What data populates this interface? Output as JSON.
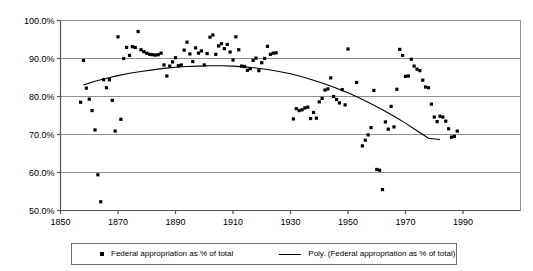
{
  "chart_data": {
    "type": "scatter",
    "title": "",
    "xlabel": "",
    "ylabel": "",
    "xlim": [
      1850,
      2010
    ],
    "ylim": [
      50,
      100
    ],
    "grid": true,
    "y_ticks": [
      50,
      60,
      70,
      80,
      90,
      100
    ],
    "y_tick_labels": [
      "50.0%",
      "60.0%",
      "70.0%",
      "80.0%",
      "90.0%",
      "100.0%"
    ],
    "x_ticks": [
      1850,
      1870,
      1890,
      1910,
      1930,
      1950,
      1970,
      1990
    ],
    "x_tick_labels": [
      "1850",
      "1870",
      "1890",
      "1910",
      "1930",
      "1950",
      "1970",
      "1990"
    ],
    "legend_position": "bottom",
    "series": [
      {
        "name": "Federal appropriation as % of total",
        "type": "scatter",
        "marker": "square",
        "color": "#000000",
        "points": [
          [
            1857,
            78.5
          ],
          [
            1858,
            89.5
          ],
          [
            1859,
            82.2
          ],
          [
            1860,
            79.3
          ],
          [
            1861,
            76.3
          ],
          [
            1862,
            71.2
          ],
          [
            1863,
            59.4
          ],
          [
            1864,
            52.3
          ],
          [
            1865,
            84.4
          ],
          [
            1866,
            82.3
          ],
          [
            1867,
            84.4
          ],
          [
            1868,
            79.0
          ],
          [
            1869,
            70.9
          ],
          [
            1870,
            95.7
          ],
          [
            1871,
            74.0
          ],
          [
            1872,
            90.0
          ],
          [
            1873,
            92.9
          ],
          [
            1874,
            90.8
          ],
          [
            1875,
            93.1
          ],
          [
            1876,
            92.9
          ],
          [
            1877,
            97.1
          ],
          [
            1878,
            92.3
          ],
          [
            1879,
            91.8
          ],
          [
            1880,
            91.4
          ],
          [
            1881,
            91.1
          ],
          [
            1882,
            91.0
          ],
          [
            1883,
            90.9
          ],
          [
            1884,
            91.0
          ],
          [
            1885,
            91.4
          ],
          [
            1886,
            88.3
          ],
          [
            1887,
            85.4
          ],
          [
            1888,
            88.0
          ],
          [
            1889,
            89.1
          ],
          [
            1890,
            90.2
          ],
          [
            1891,
            88.1
          ],
          [
            1892,
            88.3
          ],
          [
            1893,
            92.2
          ],
          [
            1894,
            94.3
          ],
          [
            1895,
            91.2
          ],
          [
            1896,
            89.2
          ],
          [
            1897,
            92.8
          ],
          [
            1898,
            91.4
          ],
          [
            1899,
            92.0
          ],
          [
            1900,
            88.3
          ],
          [
            1901,
            91.3
          ],
          [
            1902,
            95.6
          ],
          [
            1903,
            96.2
          ],
          [
            1904,
            91.1
          ],
          [
            1905,
            93.3
          ],
          [
            1906,
            93.9
          ],
          [
            1907,
            92.6
          ],
          [
            1908,
            93.7
          ],
          [
            1909,
            91.7
          ],
          [
            1910,
            89.6
          ],
          [
            1911,
            95.7
          ],
          [
            1912,
            92.3
          ],
          [
            1913,
            88.0
          ],
          [
            1914,
            87.9
          ],
          [
            1915,
            86.9
          ],
          [
            1916,
            87.3
          ],
          [
            1917,
            89.5
          ],
          [
            1918,
            90.1
          ],
          [
            1919,
            86.8
          ],
          [
            1920,
            88.9
          ],
          [
            1921,
            90.0
          ],
          [
            1922,
            93.2
          ],
          [
            1923,
            91.1
          ],
          [
            1924,
            91.4
          ],
          [
            1925,
            91.5
          ],
          [
            1931,
            74.1
          ],
          [
            1932,
            76.8
          ],
          [
            1933,
            76.3
          ],
          [
            1934,
            76.5
          ],
          [
            1935,
            77.0
          ],
          [
            1936,
            77.2
          ],
          [
            1937,
            74.2
          ],
          [
            1938,
            75.8
          ],
          [
            1939,
            74.3
          ],
          [
            1940,
            78.6
          ],
          [
            1941,
            79.5
          ],
          [
            1942,
            81.7
          ],
          [
            1943,
            82.0
          ],
          [
            1944,
            84.9
          ],
          [
            1945,
            80.0
          ],
          [
            1946,
            79.2
          ],
          [
            1947,
            78.3
          ],
          [
            1948,
            81.8
          ],
          [
            1949,
            77.8
          ],
          [
            1950,
            92.5
          ],
          [
            1953,
            83.7
          ],
          [
            1955,
            67.0
          ],
          [
            1956,
            68.5
          ],
          [
            1957,
            69.9
          ],
          [
            1958,
            71.8
          ],
          [
            1959,
            81.6
          ],
          [
            1960,
            60.8
          ],
          [
            1961,
            60.6
          ],
          [
            1962,
            55.5
          ],
          [
            1963,
            73.3
          ],
          [
            1964,
            71.4
          ],
          [
            1965,
            77.4
          ],
          [
            1966,
            72.0
          ],
          [
            1967,
            81.9
          ],
          [
            1968,
            92.4
          ],
          [
            1969,
            90.8
          ],
          [
            1970,
            85.3
          ],
          [
            1971,
            85.4
          ],
          [
            1972,
            89.8
          ],
          [
            1973,
            88.0
          ],
          [
            1974,
            87.2
          ],
          [
            1975,
            86.8
          ],
          [
            1976,
            84.3
          ],
          [
            1977,
            82.5
          ],
          [
            1978,
            82.3
          ],
          [
            1979,
            78.0
          ],
          [
            1980,
            74.6
          ],
          [
            1981,
            73.4
          ],
          [
            1982,
            74.8
          ],
          [
            1983,
            74.6
          ],
          [
            1984,
            73.5
          ],
          [
            1985,
            71.5
          ],
          [
            1986,
            69.3
          ],
          [
            1987,
            69.5
          ],
          [
            1988,
            70.9
          ]
        ]
      },
      {
        "name": "Poly. (Federal appropriation as % of total)",
        "type": "line",
        "color": "#000000",
        "points": [
          [
            1858,
            83.0
          ],
          [
            1862,
            84.0
          ],
          [
            1866,
            84.8
          ],
          [
            1870,
            85.5
          ],
          [
            1874,
            86.1
          ],
          [
            1878,
            86.6
          ],
          [
            1882,
            87.0
          ],
          [
            1886,
            87.4
          ],
          [
            1890,
            87.7
          ],
          [
            1894,
            87.9
          ],
          [
            1898,
            88.0
          ],
          [
            1902,
            88.1
          ],
          [
            1906,
            88.1
          ],
          [
            1910,
            88.0
          ],
          [
            1914,
            87.8
          ],
          [
            1918,
            87.5
          ],
          [
            1922,
            87.1
          ],
          [
            1926,
            86.6
          ],
          [
            1930,
            86.0
          ],
          [
            1934,
            85.2
          ],
          [
            1938,
            84.3
          ],
          [
            1942,
            83.3
          ],
          [
            1946,
            82.2
          ],
          [
            1950,
            81.0
          ],
          [
            1954,
            79.6
          ],
          [
            1958,
            78.1
          ],
          [
            1962,
            76.5
          ],
          [
            1966,
            74.8
          ],
          [
            1970,
            73.0
          ],
          [
            1974,
            71.0
          ],
          [
            1978,
            69.0
          ],
          [
            1982,
            68.7
          ]
        ]
      }
    ]
  },
  "legend": {
    "points_label": "Federal appropriation as % of total",
    "poly_label": "Poly. (Federal appropriation as % of total)"
  }
}
